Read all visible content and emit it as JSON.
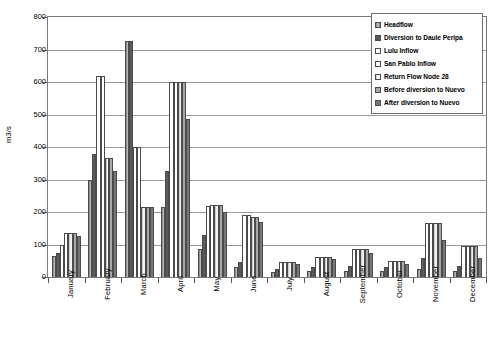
{
  "chart_data": {
    "type": "bar",
    "title": "",
    "xlabel": "",
    "ylabel": "m3/s",
    "ylim": [
      0,
      800
    ],
    "ytick_step": 100,
    "yticks": [
      0,
      100,
      200,
      300,
      400,
      500,
      600,
      700,
      800
    ],
    "grid": true,
    "legend_position": "top-right",
    "categories": [
      "January",
      "February",
      "March",
      "April",
      "May",
      "June",
      "July",
      "August",
      "September",
      "October",
      "November",
      "December"
    ],
    "series": [
      {
        "name": "Headflow",
        "values": [
          65,
          300,
          727,
          215,
          85,
          30,
          15,
          20,
          20,
          20,
          25,
          20
        ]
      },
      {
        "name": "Diversion to Daule Peripa",
        "values": [
          75,
          380,
          727,
          325,
          130,
          45,
          25,
          30,
          35,
          30,
          60,
          35
        ]
      },
      {
        "name": "Lulu Inflow",
        "values": [
          100,
          617,
          400,
          600,
          220,
          190,
          45,
          62,
          85,
          50,
          165,
          95
        ]
      },
      {
        "name": "San Pablo Inflow",
        "values": [
          135,
          617,
          400,
          600,
          222,
          190,
          45,
          62,
          85,
          50,
          165,
          95
        ]
      },
      {
        "name": "Return Flow Node 28",
        "values": [
          135,
          365,
          215,
          600,
          222,
          185,
          45,
          62,
          85,
          50,
          165,
          95
        ]
      },
      {
        "name": "Before diversion to Nuevo",
        "values": [
          135,
          365,
          215,
          600,
          222,
          185,
          45,
          62,
          85,
          50,
          165,
          95
        ]
      },
      {
        "name": "After diversion to Nuevo",
        "values": [
          125,
          325,
          215,
          485,
          200,
          170,
          40,
          55,
          75,
          40,
          115,
          60
        ]
      }
    ]
  },
  "legend": {
    "items": [
      {
        "label": "Headflow"
      },
      {
        "label": "Diversion to Daule Peripa"
      },
      {
        "label": "Lulu Inflow"
      },
      {
        "label": "San Pablo Inflow"
      },
      {
        "label": "Return Flow Node 28"
      },
      {
        "label": "Before diversion to Nuevo"
      },
      {
        "label": "After diversion to Nuevo"
      }
    ]
  },
  "colors": {
    "axis": "#7a7a7a",
    "grid": "#9a9a9a",
    "text": "#000000",
    "background": "#ffffff"
  }
}
